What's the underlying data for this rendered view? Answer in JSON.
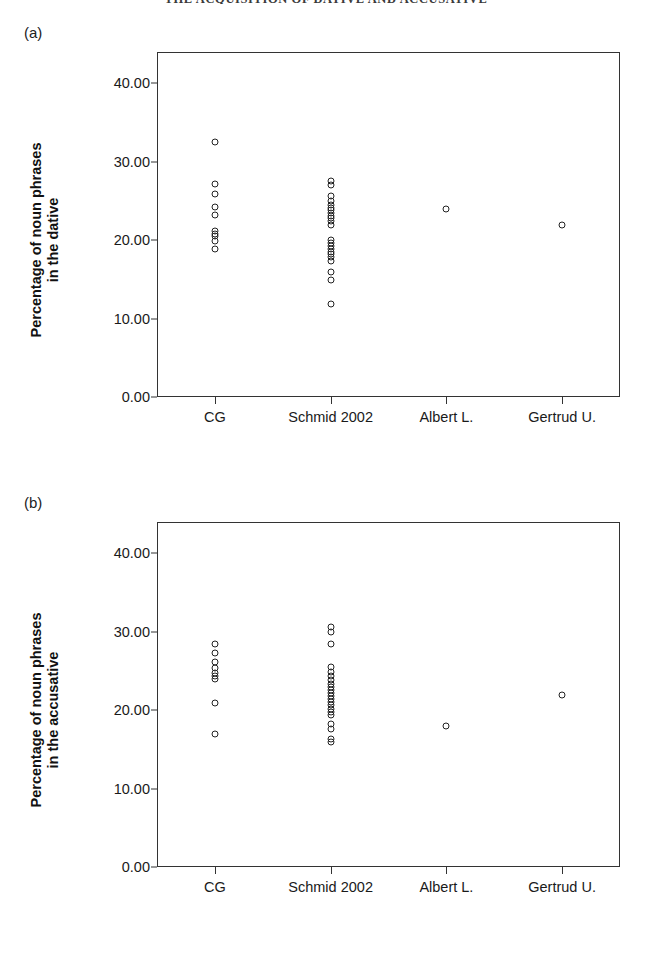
{
  "page": {
    "running_head": "THE ACQUISITION OF DATIVE AND ACCUSATIVE"
  },
  "panels": [
    {
      "label": "(a)",
      "ylabel_line1": "Percentage of noun phrases",
      "ylabel_line2": "in the dative"
    },
    {
      "label": "(b)",
      "ylabel_line1": "Percentage of noun phrases",
      "ylabel_line2": "in the accusative"
    }
  ],
  "chart_data": [
    {
      "type": "scatter",
      "title": "(a)",
      "xlabel": "",
      "ylabel": "Percentage of noun phrases in the dative",
      "categories": [
        "CG",
        "Schmid 2002",
        "Albert L.",
        "Gertrud U."
      ],
      "ylim": [
        0,
        44
      ],
      "yticks": [
        0,
        10,
        20,
        30,
        40
      ],
      "ytick_labels": [
        "0.00",
        "10.00",
        "20.00",
        "30.00",
        "40.00"
      ],
      "grid": false,
      "legend": "none",
      "marker": "open-circle",
      "series": [
        {
          "name": "CG",
          "category_index": 0,
          "values": [
            32.5,
            27.2,
            25.9,
            24.2,
            23.2,
            21.2,
            20.8,
            20.5,
            19.9,
            18.9
          ]
        },
        {
          "name": "Schmid 2002",
          "category_index": 1,
          "values": [
            27.6,
            27.1,
            25.6,
            25.0,
            24.5,
            24.1,
            23.8,
            23.5,
            23.1,
            22.8,
            22.4,
            22.0,
            20.0,
            19.6,
            19.2,
            18.9,
            18.5,
            18.2,
            17.8,
            17.4,
            15.9,
            14.9,
            11.9
          ]
        },
        {
          "name": "Albert L.",
          "category_index": 2,
          "values": [
            24.0
          ]
        },
        {
          "name": "Gertrud U.",
          "category_index": 3,
          "values": [
            22.0
          ]
        }
      ]
    },
    {
      "type": "scatter",
      "title": "(b)",
      "xlabel": "",
      "ylabel": "Percentage of noun phrases in the accusative",
      "categories": [
        "CG",
        "Schmid 2002",
        "Albert L.",
        "Gertrud U."
      ],
      "ylim": [
        0,
        44
      ],
      "yticks": [
        0,
        10,
        20,
        30,
        40
      ],
      "ytick_labels": [
        "0.00",
        "10.00",
        "20.00",
        "30.00",
        "40.00"
      ],
      "grid": false,
      "legend": "none",
      "marker": "open-circle",
      "series": [
        {
          "name": "CG",
          "category_index": 0,
          "values": [
            28.4,
            27.3,
            26.2,
            25.4,
            24.7,
            24.3,
            24.0,
            20.9,
            16.9
          ]
        },
        {
          "name": "Schmid 2002",
          "category_index": 1,
          "values": [
            30.6,
            30.0,
            28.4,
            25.5,
            24.9,
            24.4,
            23.9,
            23.4,
            23.0,
            22.6,
            22.2,
            21.8,
            21.4,
            21.0,
            20.6,
            20.2,
            19.8,
            19.4,
            18.2,
            17.6,
            16.3,
            15.9
          ]
        },
        {
          "name": "Albert L.",
          "category_index": 2,
          "values": [
            18.0
          ]
        },
        {
          "name": "Gertrud U.",
          "category_index": 3,
          "values": [
            22.0
          ]
        }
      ]
    }
  ]
}
